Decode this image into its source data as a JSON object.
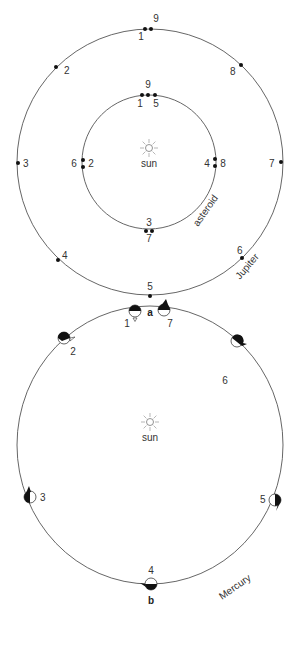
{
  "panel_a": {
    "label": "a",
    "center_label": "sun",
    "inner_orbit_label": "asteroid",
    "outer_orbit_label": "Jupiter",
    "outer_positions": [
      "1",
      "2",
      "3",
      "4",
      "5",
      "6",
      "7",
      "8",
      "9"
    ],
    "inner_positions": [
      "1",
      "2",
      "3",
      "4",
      "5",
      "6",
      "7",
      "8",
      "9"
    ]
  },
  "panel_b": {
    "label": "b",
    "center_label": "sun",
    "orbit_label": "Mercury",
    "positions": [
      "1",
      "2",
      "3",
      "4",
      "5",
      "6",
      "7"
    ]
  }
}
